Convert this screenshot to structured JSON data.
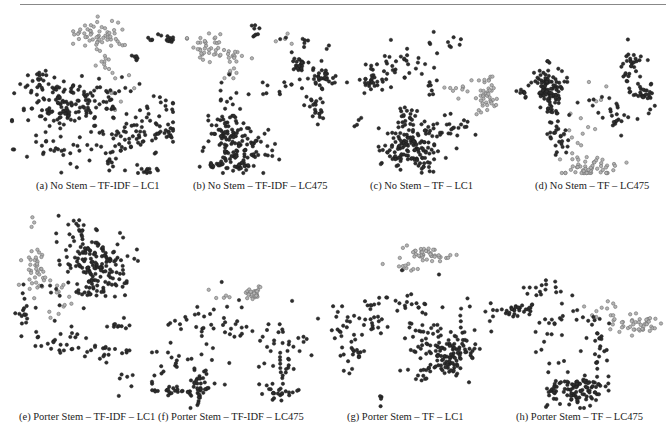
{
  "figure": {
    "panels": [
      {
        "id": "a",
        "caption": "(a) No Stem – TF-IDF – LC1",
        "box": {
          "x": 10,
          "y": 10,
          "w": 165,
          "h": 165
        },
        "caption_pos": {
          "x": 36,
          "y": 180
        },
        "clusters": [
          {
            "cls": "light",
            "cx": 92,
            "cy": 25,
            "sx": 14,
            "sy": 7,
            "n": 55
          },
          {
            "cls": "light",
            "cx": 90,
            "cy": 50,
            "sx": 6,
            "sy": 6,
            "n": 10
          },
          {
            "cls": "light",
            "cx": 110,
            "cy": 75,
            "sx": 8,
            "sy": 10,
            "n": 8
          },
          {
            "cls": "dark",
            "cx": 52,
            "cy": 95,
            "sx": 22,
            "sy": 14,
            "n": 130
          },
          {
            "cls": "dark",
            "cx": 30,
            "cy": 70,
            "sx": 8,
            "sy": 6,
            "n": 15
          },
          {
            "cls": "dark",
            "cx": 100,
            "cy": 90,
            "sx": 18,
            "sy": 10,
            "n": 30
          },
          {
            "cls": "dark",
            "cx": 125,
            "cy": 125,
            "sx": 22,
            "sy": 8,
            "n": 60
          },
          {
            "cls": "dark",
            "cx": 155,
            "cy": 120,
            "sx": 6,
            "sy": 3,
            "n": 14
          },
          {
            "cls": "dark",
            "cx": 160,
            "cy": 28,
            "sx": 6,
            "sy": 2,
            "n": 12
          },
          {
            "cls": "dark",
            "cx": 140,
            "cy": 28,
            "sx": 2,
            "sy": 2,
            "n": 4
          },
          {
            "cls": "dark",
            "cx": 125,
            "cy": 48,
            "sx": 2,
            "sy": 4,
            "n": 6
          },
          {
            "cls": "dark",
            "cx": 45,
            "cy": 140,
            "sx": 20,
            "sy": 8,
            "n": 20
          },
          {
            "cls": "dark",
            "cx": 140,
            "cy": 160,
            "sx": 7,
            "sy": 2,
            "n": 10
          },
          {
            "cls": "dark",
            "cx": 100,
            "cy": 150,
            "sx": 3,
            "sy": 5,
            "n": 8
          },
          {
            "cls": "dark",
            "cx": 80,
            "cy": 145,
            "sx": 30,
            "sy": 12,
            "n": 15
          },
          {
            "cls": "dark",
            "cx": 155,
            "cy": 95,
            "sx": 12,
            "sy": 6,
            "n": 12
          }
        ]
      },
      {
        "id": "b",
        "caption": "(b) No Stem – TF-IDF – LC475",
        "box": {
          "x": 185,
          "y": 10,
          "w": 160,
          "h": 165
        },
        "caption_pos": {
          "x": 193,
          "y": 180
        },
        "clusters": [
          {
            "cls": "light",
            "cx": 22,
            "cy": 35,
            "sx": 9,
            "sy": 7,
            "n": 35
          },
          {
            "cls": "light",
            "cx": 50,
            "cy": 45,
            "sx": 7,
            "sy": 5,
            "n": 14
          },
          {
            "cls": "light",
            "cx": 48,
            "cy": 62,
            "sx": 3,
            "sy": 6,
            "n": 8
          },
          {
            "cls": "light",
            "cx": 100,
            "cy": 28,
            "sx": 6,
            "sy": 3,
            "n": 4
          },
          {
            "cls": "dark",
            "cx": 50,
            "cy": 140,
            "sx": 14,
            "sy": 12,
            "n": 110
          },
          {
            "cls": "dark",
            "cx": 40,
            "cy": 110,
            "sx": 8,
            "sy": 12,
            "n": 30
          },
          {
            "cls": "dark",
            "cx": 30,
            "cy": 155,
            "sx": 14,
            "sy": 2,
            "n": 14
          },
          {
            "cls": "dark",
            "cx": 115,
            "cy": 55,
            "sx": 4,
            "sy": 4,
            "n": 25
          },
          {
            "cls": "dark",
            "cx": 138,
            "cy": 68,
            "sx": 8,
            "sy": 6,
            "n": 35
          },
          {
            "cls": "dark",
            "cx": 130,
            "cy": 100,
            "sx": 5,
            "sy": 8,
            "n": 22
          },
          {
            "cls": "dark",
            "cx": 120,
            "cy": 35,
            "sx": 10,
            "sy": 5,
            "n": 10
          },
          {
            "cls": "dark",
            "cx": 95,
            "cy": 80,
            "sx": 12,
            "sy": 4,
            "n": 12
          },
          {
            "cls": "dark",
            "cx": 70,
            "cy": 20,
            "sx": 3,
            "sy": 5,
            "n": 8
          },
          {
            "cls": "dark",
            "cx": 75,
            "cy": 135,
            "sx": 12,
            "sy": 10,
            "n": 12
          },
          {
            "cls": "dark",
            "cx": 60,
            "cy": 158,
            "sx": 3,
            "sy": 3,
            "n": 6
          },
          {
            "cls": "dark",
            "cx": 35,
            "cy": 80,
            "sx": 8,
            "sy": 8,
            "n": 8
          }
        ]
      },
      {
        "id": "c",
        "caption": "(c) No Stem – TF – LC1",
        "box": {
          "x": 345,
          "y": 10,
          "w": 155,
          "h": 165
        },
        "caption_pos": {
          "x": 370,
          "y": 180
        },
        "clusters": [
          {
            "cls": "light",
            "cx": 140,
            "cy": 85,
            "sx": 5,
            "sy": 10,
            "n": 40
          },
          {
            "cls": "light",
            "cx": 115,
            "cy": 78,
            "sx": 8,
            "sy": 6,
            "n": 10
          },
          {
            "cls": "dark",
            "cx": 65,
            "cy": 135,
            "sx": 14,
            "sy": 13,
            "n": 130
          },
          {
            "cls": "dark",
            "cx": 63,
            "cy": 110,
            "sx": 5,
            "sy": 6,
            "n": 18
          },
          {
            "cls": "dark",
            "cx": 25,
            "cy": 70,
            "sx": 8,
            "sy": 6,
            "n": 30
          },
          {
            "cls": "dark",
            "cx": 55,
            "cy": 55,
            "sx": 20,
            "sy": 8,
            "n": 30
          },
          {
            "cls": "dark",
            "cx": 95,
            "cy": 35,
            "sx": 12,
            "sy": 5,
            "n": 10
          },
          {
            "cls": "dark",
            "cx": 113,
            "cy": 115,
            "sx": 15,
            "sy": 7,
            "n": 22
          },
          {
            "cls": "dark",
            "cx": 85,
            "cy": 78,
            "sx": 6,
            "sy": 5,
            "n": 8
          },
          {
            "cls": "dark",
            "cx": 15,
            "cy": 110,
            "sx": 4,
            "sy": 3,
            "n": 4
          },
          {
            "cls": "dark",
            "cx": 90,
            "cy": 145,
            "sx": 12,
            "sy": 8,
            "n": 15
          }
        ]
      },
      {
        "id": "d",
        "caption": "(d) No Stem – TF – LC475",
        "box": {
          "x": 505,
          "y": 10,
          "w": 160,
          "h": 165
        },
        "caption_pos": {
          "x": 535,
          "y": 180
        },
        "clusters": [
          {
            "cls": "dark",
            "cx": 43,
            "cy": 75,
            "sx": 7,
            "sy": 10,
            "n": 90
          },
          {
            "cls": "dark",
            "cx": 47,
            "cy": 100,
            "sx": 4,
            "sy": 10,
            "n": 25
          },
          {
            "cls": "dark",
            "cx": 18,
            "cy": 83,
            "sx": 5,
            "sy": 3,
            "n": 10
          },
          {
            "cls": "dark",
            "cx": 140,
            "cy": 82,
            "sx": 6,
            "sy": 6,
            "n": 30
          },
          {
            "cls": "dark",
            "cx": 125,
            "cy": 55,
            "sx": 6,
            "sy": 12,
            "n": 30
          },
          {
            "cls": "dark",
            "cx": 112,
            "cy": 105,
            "sx": 14,
            "sy": 8,
            "n": 20
          },
          {
            "cls": "dark",
            "cx": 55,
            "cy": 130,
            "sx": 4,
            "sy": 8,
            "n": 20
          },
          {
            "cls": "dark",
            "cx": 85,
            "cy": 90,
            "sx": 14,
            "sy": 6,
            "n": 8
          },
          {
            "cls": "light",
            "cx": 85,
            "cy": 158,
            "sx": 14,
            "sy": 5,
            "n": 55
          },
          {
            "cls": "light",
            "cx": 70,
            "cy": 120,
            "sx": 10,
            "sy": 14,
            "n": 10
          },
          {
            "cls": "light",
            "cx": 95,
            "cy": 85,
            "sx": 10,
            "sy": 6,
            "n": 4
          }
        ]
      },
      {
        "id": "e",
        "caption": "(e) Porter Stem – TF-IDF – LC1",
        "box": {
          "x": 10,
          "y": 200,
          "w": 130,
          "h": 205
        },
        "caption_pos": {
          "x": 19,
          "y": 411
        },
        "wrap": true,
        "clusters": [
          {
            "cls": "dark",
            "cx": 85,
            "cy": 65,
            "sx": 15,
            "sy": 15,
            "n": 150
          },
          {
            "cls": "dark",
            "cx": 65,
            "cy": 30,
            "sx": 10,
            "sy": 10,
            "n": 20
          },
          {
            "cls": "light",
            "cx": 27,
            "cy": 72,
            "sx": 6,
            "sy": 10,
            "n": 40
          },
          {
            "cls": "light",
            "cx": 50,
            "cy": 100,
            "sx": 6,
            "sy": 10,
            "n": 12
          },
          {
            "cls": "light",
            "cx": 22,
            "cy": 25,
            "sx": 2,
            "sy": 5,
            "n": 3
          },
          {
            "cls": "dark",
            "cx": 15,
            "cy": 115,
            "sx": 4,
            "sy": 10,
            "n": 15
          },
          {
            "cls": "dark",
            "cx": 60,
            "cy": 95,
            "sx": 14,
            "sy": 7,
            "n": 20
          },
          {
            "cls": "dark",
            "cx": 50,
            "cy": 140,
            "sx": 15,
            "sy": 8,
            "n": 25
          },
          {
            "cls": "dark",
            "cx": 90,
            "cy": 152,
            "sx": 15,
            "sy": 5,
            "n": 20
          },
          {
            "cls": "dark",
            "cx": 118,
            "cy": 125,
            "sx": 8,
            "sy": 3,
            "n": 10
          },
          {
            "cls": "dark",
            "cx": 115,
            "cy": 185,
            "sx": 6,
            "sy": 10,
            "n": 6
          }
        ]
      },
      {
        "id": "f",
        "caption": "(f) Porter Stem – TF-IDF – LC475",
        "box": {
          "x": 150,
          "y": 280,
          "w": 170,
          "h": 130
        },
        "caption_pos": {
          "x": 158,
          "y": 411
        },
        "clusters": [
          {
            "cls": "light",
            "cx": 102,
            "cy": 14,
            "sx": 6,
            "sy": 4,
            "n": 25
          },
          {
            "cls": "light",
            "cx": 70,
            "cy": 20,
            "sx": 10,
            "sy": 6,
            "n": 5
          },
          {
            "cls": "dark",
            "cx": 50,
            "cy": 105,
            "sx": 5,
            "sy": 12,
            "n": 40
          },
          {
            "cls": "dark",
            "cx": 25,
            "cy": 110,
            "sx": 14,
            "sy": 3,
            "n": 25
          },
          {
            "cls": "dark",
            "cx": 20,
            "cy": 85,
            "sx": 10,
            "sy": 8,
            "n": 15
          },
          {
            "cls": "dark",
            "cx": 130,
            "cy": 112,
            "sx": 12,
            "sy": 5,
            "n": 25
          },
          {
            "cls": "dark",
            "cx": 135,
            "cy": 90,
            "sx": 5,
            "sy": 6,
            "n": 12
          },
          {
            "cls": "dark",
            "cx": 90,
            "cy": 55,
            "sx": 30,
            "sy": 20,
            "n": 40
          },
          {
            "cls": "dark",
            "cx": 130,
            "cy": 65,
            "sx": 15,
            "sy": 10,
            "n": 20
          },
          {
            "cls": "dark",
            "cx": 40,
            "cy": 40,
            "sx": 15,
            "sy": 10,
            "n": 15
          }
        ]
      },
      {
        "id": "g",
        "caption": "(g) Porter Stem – TF – LC1",
        "box": {
          "x": 325,
          "y": 240,
          "w": 170,
          "h": 170
        },
        "caption_pos": {
          "x": 347,
          "y": 411
        },
        "clusters": [
          {
            "cls": "light",
            "cx": 100,
            "cy": 15,
            "sx": 12,
            "sy": 4,
            "n": 40
          },
          {
            "cls": "light",
            "cx": 80,
            "cy": 28,
            "sx": 8,
            "sy": 3,
            "n": 10
          },
          {
            "cls": "dark",
            "cx": 125,
            "cy": 115,
            "sx": 12,
            "sy": 10,
            "n": 110
          },
          {
            "cls": "dark",
            "cx": 95,
            "cy": 95,
            "sx": 10,
            "sy": 10,
            "n": 30
          },
          {
            "cls": "dark",
            "cx": 28,
            "cy": 115,
            "sx": 6,
            "sy": 8,
            "n": 20
          },
          {
            "cls": "dark",
            "cx": 15,
            "cy": 80,
            "sx": 5,
            "sy": 10,
            "n": 15
          },
          {
            "cls": "dark",
            "cx": 45,
            "cy": 80,
            "sx": 10,
            "sy": 15,
            "n": 25
          },
          {
            "cls": "dark",
            "cx": 80,
            "cy": 60,
            "sx": 15,
            "sy": 10,
            "n": 20
          },
          {
            "cls": "dark",
            "cx": 140,
            "cy": 80,
            "sx": 15,
            "sy": 10,
            "n": 15
          },
          {
            "cls": "dark",
            "cx": 95,
            "cy": 135,
            "sx": 6,
            "sy": 6,
            "n": 10
          },
          {
            "cls": "dark",
            "cx": 56,
            "cy": 160,
            "sx": 1,
            "sy": 4,
            "n": 4
          }
        ]
      },
      {
        "id": "h",
        "caption": "(h) Porter Stem – TF – LC475",
        "box": {
          "x": 495,
          "y": 270,
          "w": 170,
          "h": 140
        },
        "caption_pos": {
          "x": 516,
          "y": 411
        },
        "clusters": [
          {
            "cls": "dark",
            "cx": 80,
            "cy": 120,
            "sx": 14,
            "sy": 8,
            "n": 100
          },
          {
            "cls": "dark",
            "cx": 20,
            "cy": 40,
            "sx": 10,
            "sy": 3,
            "n": 30
          },
          {
            "cls": "dark",
            "cx": 55,
            "cy": 20,
            "sx": 12,
            "sy": 5,
            "n": 15
          },
          {
            "cls": "dark",
            "cx": 75,
            "cy": 50,
            "sx": 25,
            "sy": 8,
            "n": 25
          },
          {
            "cls": "dark",
            "cx": 105,
            "cy": 90,
            "sx": 4,
            "sy": 18,
            "n": 20
          },
          {
            "cls": "dark",
            "cx": 60,
            "cy": 85,
            "sx": 10,
            "sy": 15,
            "n": 12
          },
          {
            "cls": "light",
            "cx": 145,
            "cy": 55,
            "sx": 12,
            "sy": 5,
            "n": 40
          },
          {
            "cls": "light",
            "cx": 110,
            "cy": 40,
            "sx": 12,
            "sy": 10,
            "n": 15
          }
        ]
      }
    ]
  }
}
